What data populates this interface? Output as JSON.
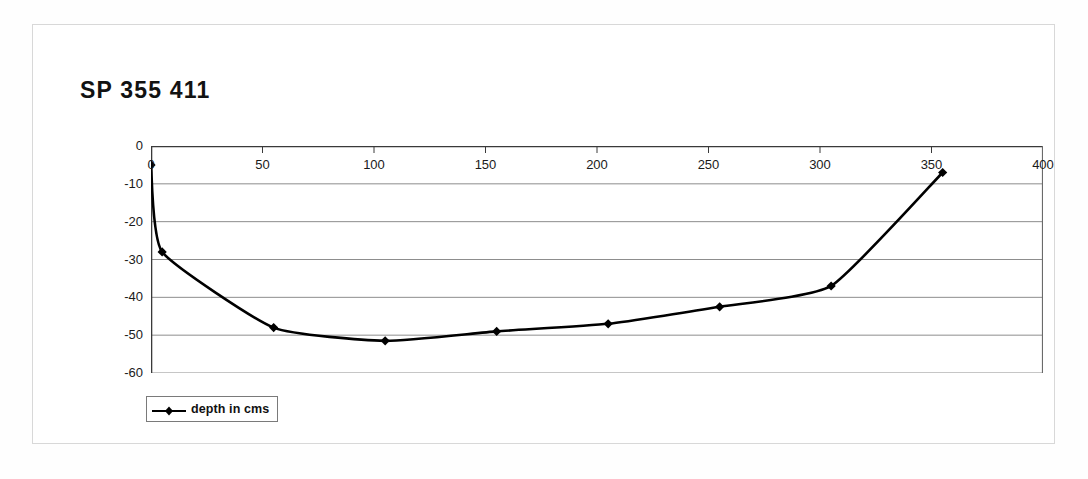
{
  "title": "SP 355 411",
  "legend": {
    "label": "depth in cms",
    "marker": "diamond-line-marker"
  },
  "chart_data": {
    "type": "line",
    "title": "SP 355 411",
    "xlabel": "",
    "ylabel": "",
    "xlim": [
      0,
      400
    ],
    "ylim": [
      -60,
      0
    ],
    "xticks": [
      0,
      50,
      100,
      150,
      200,
      250,
      300,
      350,
      400
    ],
    "xtick_labels": [
      "0",
      "50",
      "100",
      "150",
      "200",
      "250",
      "300",
      "350",
      "400"
    ],
    "yticks": [
      0,
      -10,
      -20,
      -30,
      -40,
      -50,
      -60
    ],
    "ytick_labels": [
      "0",
      "-10",
      "-20",
      "-30",
      "-40",
      "-50",
      "-60"
    ],
    "grid": true,
    "grid_axis": "y",
    "legend_position": "below-left",
    "series": [
      {
        "name": "depth in cms",
        "color": "#000000",
        "marker": "diamond",
        "x": [
          0,
          5,
          55,
          105,
          155,
          205,
          255,
          305,
          355
        ],
        "y": [
          -5,
          -28,
          -48,
          -51.5,
          -49,
          -47,
          -42.5,
          -37,
          -7
        ]
      }
    ]
  }
}
